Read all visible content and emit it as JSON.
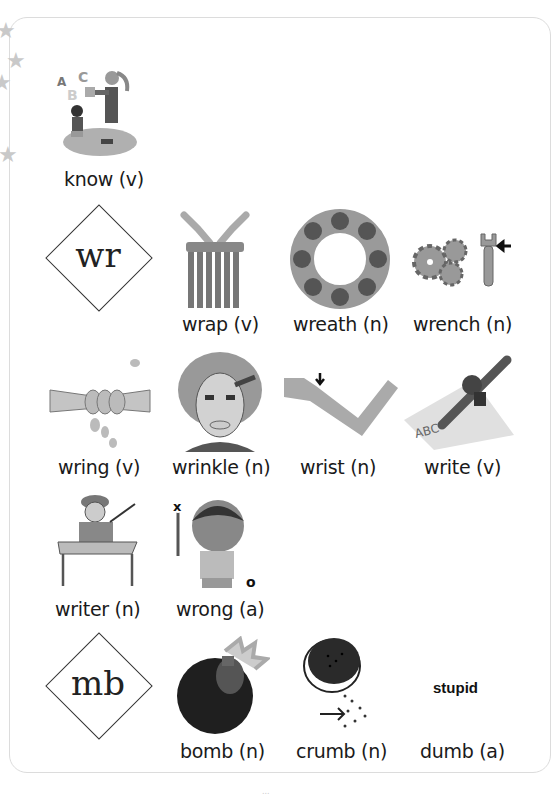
{
  "page": {
    "headword_rows": [
      {
        "items": [
          {
            "id": "know",
            "label": "know (v)"
          }
        ]
      },
      {
        "pattern": "wr",
        "items": [
          {
            "id": "wrap",
            "label": "wrap (v)"
          },
          {
            "id": "wreath",
            "label": "wreath (n)"
          },
          {
            "id": "wrench",
            "label": "wrench (n)"
          }
        ]
      },
      {
        "items": [
          {
            "id": "wring",
            "label": "wring (v)"
          },
          {
            "id": "wrinkle",
            "label": "wrinkle (n)"
          },
          {
            "id": "wrist",
            "label": "wrist (n)"
          },
          {
            "id": "write",
            "label": "write (v)"
          }
        ]
      },
      {
        "items": [
          {
            "id": "writer",
            "label": "writer (n)"
          },
          {
            "id": "wrong",
            "label": "wrong (a)"
          }
        ]
      },
      {
        "pattern": "mb",
        "items": [
          {
            "id": "bomb",
            "label": "bomb (n)"
          },
          {
            "id": "crumb",
            "label": "crumb (n)"
          },
          {
            "id": "dumb",
            "label": "dumb (a)",
            "picture_text": "stupid"
          }
        ]
      }
    ],
    "illustration_letters": {
      "a": "A",
      "b": "B",
      "c": "C"
    },
    "write_paper_text": "ABC",
    "wrong_marks": {
      "x": "x",
      "o": "o"
    },
    "page_number": "..."
  },
  "colors": {
    "ink": "#1a1a1a",
    "border": "#dcdcdc",
    "star": "#c9c9c9",
    "illustration_gray": "#8a8a8a"
  }
}
